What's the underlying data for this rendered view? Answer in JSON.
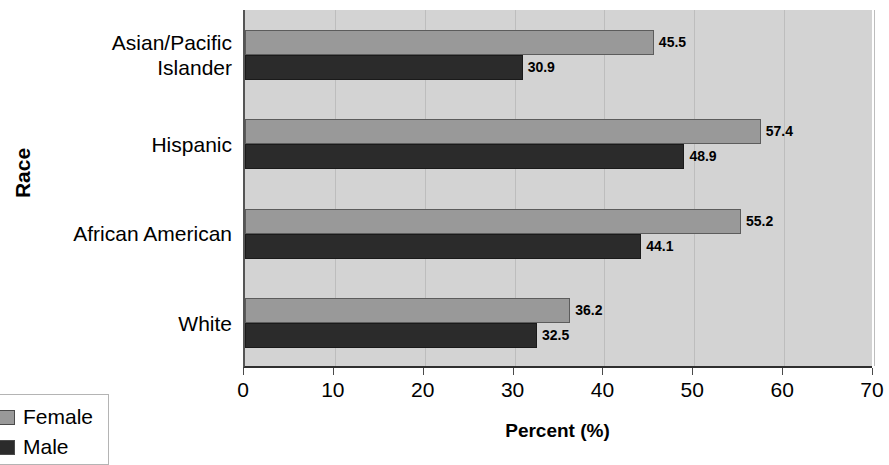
{
  "chart_data": {
    "type": "bar",
    "orientation": "horizontal",
    "title": "",
    "xlabel": "Percent (%)",
    "ylabel": "Race",
    "xlim": [
      0,
      70
    ],
    "xticks": [
      0,
      10,
      20,
      30,
      40,
      50,
      60,
      70
    ],
    "xtick_labels": [
      "0",
      "10",
      "20",
      "30",
      "40",
      "50",
      "60",
      "70"
    ],
    "grid": true,
    "grid_axis": "x",
    "legend_position": "lower-left-outside",
    "categories": [
      "White",
      "African American",
      "Hispanic",
      "Asian/Pacific Islander"
    ],
    "category_lines": [
      [
        "White"
      ],
      [
        "African American"
      ],
      [
        "Hispanic"
      ],
      [
        "Asian/Pacific",
        "Islander"
      ]
    ],
    "series": [
      {
        "name": "Female",
        "color": "#999999",
        "values": [
          36.2,
          55.2,
          57.4,
          45.5
        ],
        "labels": [
          "36.2",
          "55.2",
          "57.4",
          "45.5"
        ]
      },
      {
        "name": "Male",
        "color": "#2b2b2b",
        "values": [
          32.5,
          44.1,
          48.9,
          30.9
        ],
        "labels": [
          "32.5",
          "44.1",
          "48.9",
          "30.9"
        ]
      }
    ]
  },
  "legend": {
    "items": [
      {
        "label": "Female",
        "color": "#999999"
      },
      {
        "label": "Male",
        "color": "#2b2b2b"
      }
    ]
  },
  "axes": {
    "x_title": "Percent (%)",
    "y_title": "Race"
  },
  "colors": {
    "plot_background": "#d3d3d3",
    "page_background": "#ffffff",
    "gridline": "#bdbdbd",
    "axis_line": "#2f2f2f",
    "female": "#999999",
    "male": "#2b2b2b",
    "text": "#000000"
  }
}
